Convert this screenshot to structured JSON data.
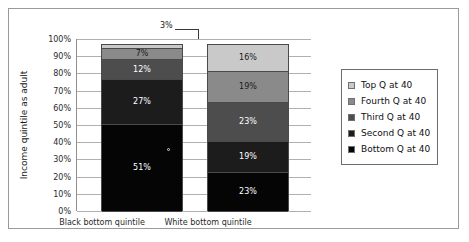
{
  "chart_data": {
    "type": "bar",
    "subtype": "stacked-100-percent",
    "title": "",
    "xlabel": "",
    "ylabel": "Income quintile as adult",
    "categories": [
      "Black bottom quintile",
      "White bottom quintile"
    ],
    "ylim": [
      0,
      100
    ],
    "ytick_labels": [
      "0%",
      "10%",
      "20%",
      "30%",
      "40%",
      "50%",
      "60%",
      "70%",
      "80%",
      "90%",
      "100%"
    ],
    "ytick_values": [
      0,
      10,
      20,
      30,
      40,
      50,
      60,
      70,
      80,
      90,
      100
    ],
    "grid": true,
    "legend_position": "right",
    "stack_order_bottom_to_top": [
      "Bottom Q at 40",
      "Second Q at 40",
      "Third Q at 40",
      "Fourth Q at 40",
      "Top Q at 40"
    ],
    "series": [
      {
        "name": "Bottom Q at 40",
        "color": "#050505",
        "values": [
          51,
          23
        ],
        "labels": [
          "51%",
          "23%"
        ],
        "label_on_dark": true
      },
      {
        "name": "Second Q at 40",
        "color": "#1c1c1c",
        "values": [
          27,
          19
        ],
        "labels": [
          "27%",
          "19%"
        ],
        "label_on_dark": true
      },
      {
        "name": "Third Q at 40",
        "color": "#4d4d4d",
        "values": [
          12,
          23
        ],
        "labels": [
          "12%",
          "23%"
        ],
        "label_on_dark": true
      },
      {
        "name": "Fourth Q at 40",
        "color": "#8a8a8a",
        "values": [
          7,
          19
        ],
        "labels": [
          "7%",
          "19%"
        ],
        "label_on_dark": true
      },
      {
        "name": "Top Q at 40",
        "color": "#c9c9c9",
        "values": [
          3,
          16
        ],
        "labels": [
          "3%",
          "16%"
        ],
        "label_on_dark": false
      }
    ],
    "annotations": [
      {
        "text": "3%",
        "note": "callout label with leader line pointing to the 3% top segment of the Black bottom quintile bar"
      }
    ]
  },
  "axis": {
    "y_title": "Income quintile as adult",
    "ticks": [
      "100%",
      "90%",
      "80%",
      "70%",
      "60%",
      "50%",
      "40%",
      "30%",
      "20%",
      "10%",
      "0%"
    ]
  },
  "bars": {
    "black": {
      "category": "Black bottom quintile",
      "segments_top_to_bottom": [
        {
          "label": "3%",
          "value": 3,
          "color": "#c9c9c9",
          "label_visible": false
        },
        {
          "label": "7%",
          "value": 7,
          "color": "#8a8a8a",
          "label_visible": true
        },
        {
          "label": "12%",
          "value": 12,
          "color": "#4d4d4d",
          "label_visible": true
        },
        {
          "label": "27%",
          "value": 27,
          "color": "#1c1c1c",
          "label_visible": true
        },
        {
          "label": "51%",
          "value": 51,
          "color": "#050505",
          "label_visible": true
        }
      ]
    },
    "white": {
      "category": "White bottom quintile",
      "segments_top_to_bottom": [
        {
          "label": "16%",
          "value": 16,
          "color": "#c9c9c9",
          "label_visible": true
        },
        {
          "label": "19%",
          "value": 19,
          "color": "#8a8a8a",
          "label_visible": true
        },
        {
          "label": "23%",
          "value": 23,
          "color": "#4d4d4d",
          "label_visible": true
        },
        {
          "label": "19%",
          "value": 19,
          "color": "#1c1c1c",
          "label_visible": true
        },
        {
          "label": "23%",
          "value": 23,
          "color": "#050505",
          "label_visible": true
        }
      ]
    }
  },
  "callout": {
    "text": "3%"
  },
  "legend": {
    "items": [
      {
        "label": "Top Q at 40",
        "color": "#c9c9c9"
      },
      {
        "label": "Fourth Q at 40",
        "color": "#8a8a8a"
      },
      {
        "label": "Third Q at 40",
        "color": "#4d4d4d"
      },
      {
        "label": "Second Q at 40",
        "color": "#1c1c1c"
      },
      {
        "label": "Bottom Q at 40",
        "color": "#050505"
      }
    ]
  }
}
